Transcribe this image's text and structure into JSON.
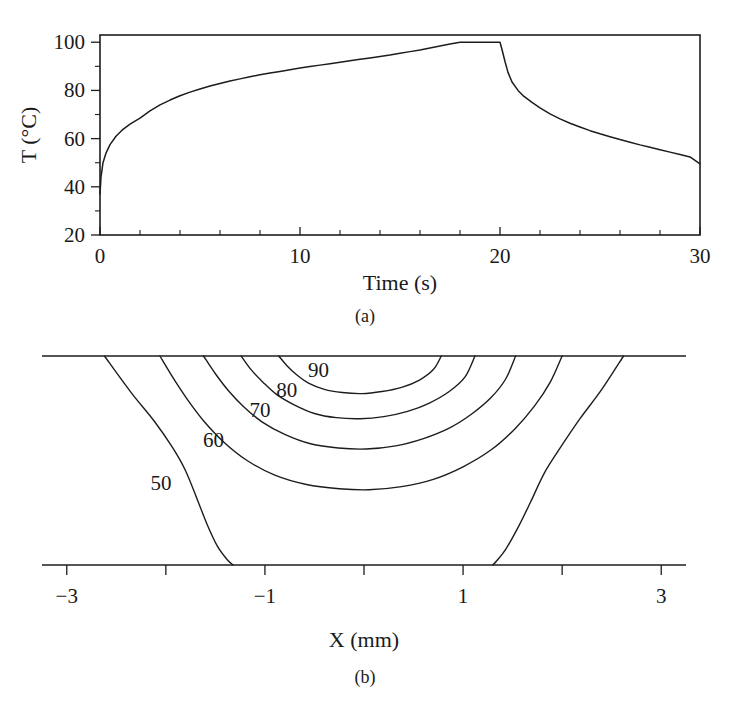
{
  "figure": {
    "panels": [
      {
        "id": "a",
        "caption": "(a)"
      },
      {
        "id": "b",
        "caption": "(b)"
      }
    ]
  },
  "chart_data": [
    {
      "type": "line",
      "panel": "(a)",
      "title": "",
      "xlabel": "Time (s)",
      "ylabel": "T (°C)",
      "xlim": [
        0,
        30
      ],
      "ylim": [
        20,
        103
      ],
      "grid": false,
      "legend": null,
      "xticks": [
        0,
        10,
        20,
        30
      ],
      "xtick_labels": [
        "0",
        "10",
        "20",
        "30"
      ],
      "xticks_minor": [
        2,
        4,
        6,
        8,
        12,
        14,
        16,
        18,
        22,
        24,
        26,
        28
      ],
      "yticks": [
        20,
        40,
        60,
        80,
        100
      ],
      "ytick_labels": [
        "20",
        "40",
        "60",
        "80",
        "100"
      ],
      "yticks_minor": [
        30,
        50,
        70,
        90
      ],
      "series": [
        {
          "name": "Temperature",
          "x": [
            0,
            0.05,
            0.15,
            0.3,
            0.5,
            0.8,
            1.1,
            1.5,
            2.0,
            2.5,
            3.0,
            3.5,
            4.0,
            4.5,
            5.0,
            5.5,
            6.0,
            6.5,
            7.0,
            7.5,
            8.0,
            8.5,
            9.0,
            9.5,
            10.0,
            10.5,
            11.0,
            11.5,
            12.0,
            12.5,
            13.0,
            13.5,
            14.0,
            14.5,
            15.0,
            15.5,
            16.0,
            16.5,
            17.0,
            17.5,
            18.0,
            18.5,
            19.0,
            19.5,
            20.0,
            20.1,
            20.25,
            20.4,
            20.6,
            20.9,
            21.2,
            21.6,
            22.0,
            22.5,
            23.0,
            23.5,
            24.0,
            24.5,
            25.0,
            25.5,
            26.0,
            26.5,
            27.0,
            27.5,
            28.0,
            28.5,
            29.0,
            29.5,
            30.0
          ],
          "y": [
            37.0,
            44.0,
            50.0,
            54.0,
            57.5,
            61.0,
            63.5,
            66.0,
            68.5,
            71.5,
            74.0,
            76.0,
            77.8,
            79.3,
            80.6,
            81.8,
            82.9,
            83.9,
            84.8,
            85.7,
            86.5,
            87.2,
            87.9,
            88.6,
            89.3,
            89.9,
            90.5,
            91.1,
            91.7,
            92.3,
            92.9,
            93.5,
            94.1,
            94.7,
            95.4,
            96.1,
            96.8,
            97.6,
            98.4,
            99.3,
            100.0,
            100.0,
            100.0,
            100.0,
            100.0,
            97.0,
            92.0,
            87.5,
            83.5,
            80.0,
            77.5,
            75.0,
            72.8,
            70.3,
            68.2,
            66.4,
            64.8,
            63.3,
            62.0,
            60.8,
            59.6,
            58.5,
            57.4,
            56.4,
            55.4,
            54.4,
            53.4,
            52.4,
            49.5
          ]
        }
      ]
    },
    {
      "type": "contour",
      "panel": "(b)",
      "title": "",
      "xlabel": "X (mm)",
      "ylabel": "",
      "xlim": [
        -3.25,
        3.25
      ],
      "ylim": [
        -2.0,
        0.0
      ],
      "grid": false,
      "legend": null,
      "xticks": [
        -3,
        -2,
        -1,
        0,
        1,
        2,
        3
      ],
      "xtick_labels": [
        "−3",
        "",
        "−1",
        "",
        "1",
        "",
        "3"
      ],
      "levels": [
        50,
        60,
        70,
        80,
        90
      ],
      "level_labels": [
        "50",
        "60",
        "70",
        "80",
        "90"
      ],
      "contours": [
        {
          "level": 50,
          "label": "50",
          "label_x": -2.05,
          "label_y": -1.22,
          "left_path": [
            [
              -2.62,
              0.0
            ],
            [
              -2.35,
              -0.35
            ],
            [
              -2.12,
              -0.62
            ],
            [
              -1.93,
              -0.88
            ],
            [
              -1.8,
              -1.1
            ],
            [
              -1.68,
              -1.38
            ],
            [
              -1.58,
              -1.62
            ],
            [
              -1.48,
              -1.82
            ],
            [
              -1.38,
              -1.95
            ],
            [
              -1.32,
              -2.0
            ]
          ],
          "right_path": [
            [
              2.62,
              0.0
            ],
            [
              2.4,
              -0.32
            ],
            [
              2.18,
              -0.6
            ],
            [
              1.98,
              -0.88
            ],
            [
              1.82,
              -1.12
            ],
            [
              1.68,
              -1.4
            ],
            [
              1.55,
              -1.65
            ],
            [
              1.43,
              -1.85
            ],
            [
              1.34,
              -1.96
            ],
            [
              1.3,
              -2.0
            ]
          ]
        },
        {
          "level": 60,
          "label": "60",
          "label_x": -1.52,
          "label_y": -0.8,
          "path": [
            [
              -2.06,
              0.0
            ],
            [
              -1.92,
              -0.22
            ],
            [
              -1.78,
              -0.42
            ],
            [
              -1.62,
              -0.62
            ],
            [
              -1.42,
              -0.82
            ],
            [
              -1.18,
              -1.0
            ],
            [
              -0.9,
              -1.14
            ],
            [
              -0.58,
              -1.23
            ],
            [
              -0.25,
              -1.27
            ],
            [
              0.05,
              -1.28
            ],
            [
              0.38,
              -1.25
            ],
            [
              0.7,
              -1.18
            ],
            [
              1.0,
              -1.06
            ],
            [
              1.28,
              -0.9
            ],
            [
              1.52,
              -0.7
            ],
            [
              1.72,
              -0.48
            ],
            [
              1.88,
              -0.25
            ],
            [
              2.0,
              0.0
            ]
          ]
        },
        {
          "level": 70,
          "label": "70",
          "label_x": -1.05,
          "label_y": -0.52,
          "path": [
            [
              -1.62,
              0.0
            ],
            [
              -1.5,
              -0.17
            ],
            [
              -1.37,
              -0.33
            ],
            [
              -1.22,
              -0.48
            ],
            [
              -1.03,
              -0.63
            ],
            [
              -0.8,
              -0.75
            ],
            [
              -0.54,
              -0.84
            ],
            [
              -0.26,
              -0.88
            ],
            [
              0.02,
              -0.89
            ],
            [
              0.32,
              -0.86
            ],
            [
              0.6,
              -0.79
            ],
            [
              0.86,
              -0.69
            ],
            [
              1.08,
              -0.56
            ],
            [
              1.28,
              -0.4
            ],
            [
              1.43,
              -0.22
            ],
            [
              1.53,
              0.0
            ]
          ]
        },
        {
          "level": 80,
          "label": "80",
          "label_x": -0.78,
          "label_y": -0.33,
          "path": [
            [
              -1.24,
              0.0
            ],
            [
              -1.14,
              -0.13
            ],
            [
              -1.02,
              -0.25
            ],
            [
              -0.88,
              -0.37
            ],
            [
              -0.7,
              -0.47
            ],
            [
              -0.5,
              -0.55
            ],
            [
              -0.28,
              -0.59
            ],
            [
              -0.04,
              -0.6
            ],
            [
              0.2,
              -0.58
            ],
            [
              0.44,
              -0.53
            ],
            [
              0.66,
              -0.45
            ],
            [
              0.86,
              -0.34
            ],
            [
              1.02,
              -0.2
            ],
            [
              1.12,
              0.0
            ]
          ]
        },
        {
          "level": 90,
          "label": "90",
          "label_x": -0.46,
          "label_y": -0.13,
          "path": [
            [
              -0.86,
              0.0
            ],
            [
              -0.78,
              -0.09
            ],
            [
              -0.68,
              -0.18
            ],
            [
              -0.56,
              -0.26
            ],
            [
              -0.4,
              -0.32
            ],
            [
              -0.22,
              -0.35
            ],
            [
              -0.02,
              -0.36
            ],
            [
              0.18,
              -0.34
            ],
            [
              0.38,
              -0.3
            ],
            [
              0.56,
              -0.23
            ],
            [
              0.7,
              -0.13
            ],
            [
              0.78,
              0.0
            ]
          ]
        }
      ]
    }
  ]
}
